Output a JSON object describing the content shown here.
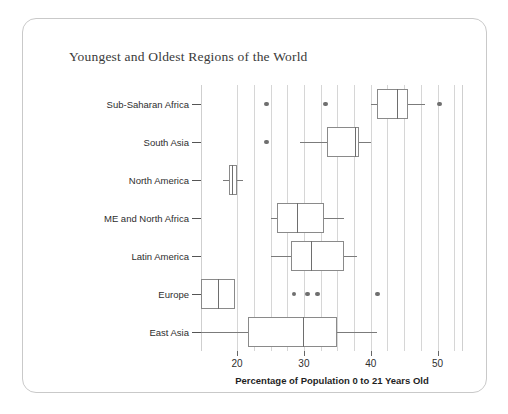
{
  "card": {
    "title": "Youngest and Oldest Regions of the World"
  },
  "chart_data": {
    "type": "box",
    "title": "Youngest and Oldest Regions of the World",
    "xlabel": "Percentage of Population 0 to 21 Years Old",
    "ylabel": "",
    "xlim": [
      14.6,
      53.8
    ],
    "xticks": [
      20,
      30,
      40,
      50
    ],
    "xtick_labels": [
      "20",
      "30",
      "40",
      "50"
    ],
    "grid": "vertical",
    "legend": "none",
    "categories": [
      "Sub-Saharan Africa",
      "South Asia",
      "North America",
      "ME and North Africa",
      "Latin America",
      "Europe",
      "East Asia"
    ],
    "boxes": [
      {
        "category": "Sub-Saharan Africa",
        "whisker_low": 40.1,
        "q1": 41.0,
        "median": 43.9,
        "q3": 45.5,
        "whisker_high": 48.1,
        "outliers": [
          24.4,
          33.2,
          50.3
        ]
      },
      {
        "category": "South Asia",
        "whisker_low": 29.4,
        "q1": 33.5,
        "median": 37.7,
        "q3": 38.2,
        "whisker_high": 40.1,
        "outliers": [
          24.4
        ]
      },
      {
        "category": "North America",
        "whisker_low": 17.9,
        "q1": 18.8,
        "median": 19.2,
        "q3": 20.0,
        "whisker_high": 20.9,
        "outliers": []
      },
      {
        "category": "ME and North Africa",
        "whisker_low": 25.0,
        "q1": 26.0,
        "median": 29.0,
        "q3": 33.0,
        "whisker_high": 36.0,
        "outliers": []
      },
      {
        "category": "Latin America",
        "whisker_low": 25.0,
        "q1": 28.0,
        "median": 31.0,
        "q3": 36.0,
        "whisker_high": 38.0,
        "outliers": []
      },
      {
        "category": "Europe",
        "whisker_low": 14.6,
        "q1": 14.6,
        "median": 17.2,
        "q3": 19.7,
        "whisker_high": 19.7,
        "outliers": [
          28.5,
          30.5,
          32.0,
          41.0
        ]
      },
      {
        "category": "East Asia",
        "whisker_low": 14.6,
        "q1": 21.6,
        "median": 29.9,
        "q3": 35.0,
        "whisker_high": 41.0,
        "outliers": []
      }
    ]
  }
}
